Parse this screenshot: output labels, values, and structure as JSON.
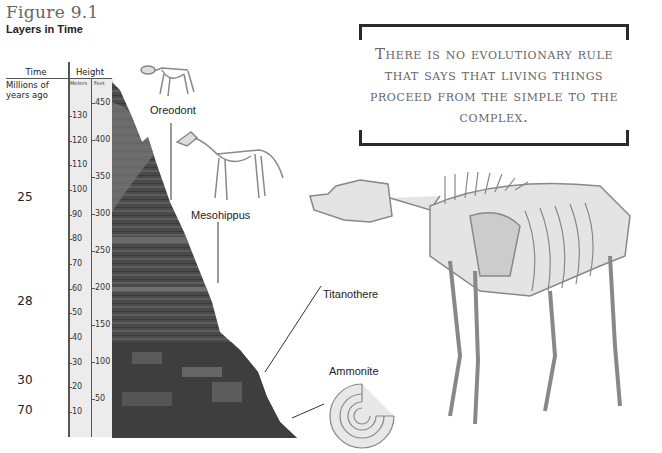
{
  "figure": {
    "number": "Figure 9.1",
    "title": "Layers in Time"
  },
  "scale": {
    "time_header": "Time",
    "height_header": "Height",
    "time_subheader": "Millions of years ago",
    "meters_header": "Meters",
    "feet_header": "Feet",
    "meters_ticks": [
      "130",
      "120",
      "110",
      "100",
      "90",
      "80",
      "70",
      "60",
      "50",
      "40",
      "30",
      "20",
      "10"
    ],
    "feet_ticks": [
      "450",
      "400",
      "350",
      "300",
      "250",
      "200",
      "150",
      "100",
      "50"
    ],
    "ages": [
      "25",
      "28",
      "30",
      "70"
    ]
  },
  "quote": {
    "text": "There is no evolutionary rule that says that living things proceed from the simple to the complex."
  },
  "fossils": {
    "oreodont": "Oreodont",
    "mesohippus": "Mesohippus",
    "titanothere": "Titanothere",
    "ammonite": "Ammonite"
  }
}
